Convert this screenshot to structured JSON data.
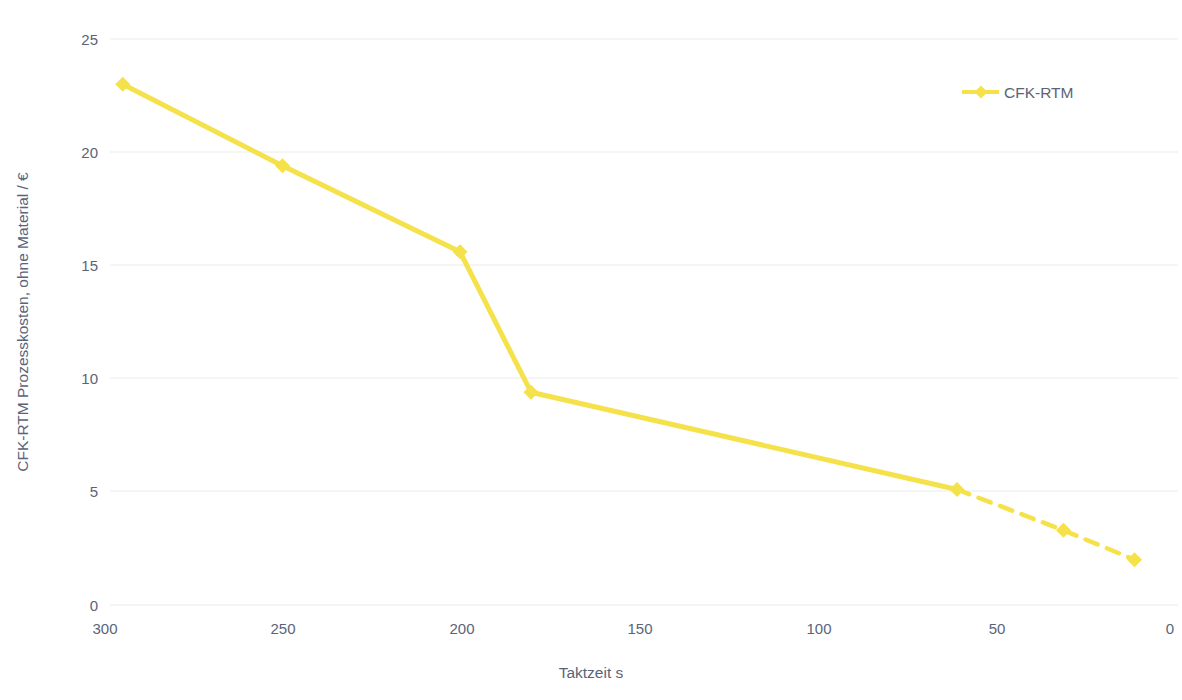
{
  "chart_data": {
    "type": "line",
    "title": "",
    "subtitle": "",
    "xlabel": "Taktzeit s",
    "ylabel": "CFK-RTM Prozesskosten, ohne Material / €",
    "xlim": [
      300,
      0
    ],
    "ylim": [
      0,
      25
    ],
    "x_reversed": true,
    "grid": true,
    "grid_axis": "y",
    "legend_position": "top-right",
    "xticks": [
      300,
      250,
      200,
      150,
      100,
      50,
      0
    ],
    "xtick_labels": [
      "300",
      "250",
      "200",
      "150",
      "100",
      "50",
      "0"
    ],
    "yticks": [
      0,
      5,
      10,
      15,
      20,
      25
    ],
    "ytick_labels": [
      "0",
      "5",
      "10",
      "15",
      "20",
      "25"
    ],
    "series": [
      {
        "name": "CFK-RTM",
        "color": "#f5e14a",
        "marker": "diamond",
        "x": [
          295,
          250,
          200,
          180,
          60,
          30,
          10
        ],
        "values": [
          23.0,
          19.4,
          15.6,
          9.4,
          5.1,
          3.3,
          2.0
        ],
        "solid_until_index": 4,
        "dashed_from_index": 4
      }
    ]
  },
  "axes": {
    "y_title": "CFK-RTM Prozesskosten, ohne Material / €",
    "x_title": "Taktzeit s"
  },
  "legend": {
    "entries": [
      {
        "label": "CFK-RTM",
        "color": "#f5e14a",
        "marker": "diamond"
      }
    ]
  },
  "colors": {
    "series": "#f5e14a",
    "grid": "#ececec",
    "axis_line": "#eef1f5",
    "text": "#5a6478",
    "background": "#ffffff"
  }
}
